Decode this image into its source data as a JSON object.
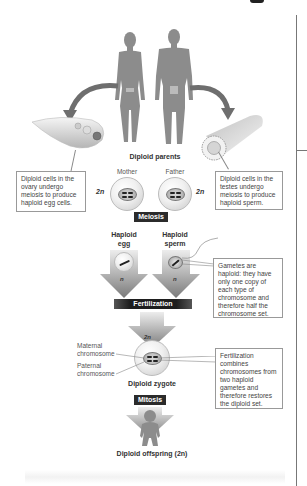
{
  "parents": {
    "label": "Diploid parents",
    "mother": "Mother",
    "father": "Father",
    "ploidy_left": "2n",
    "ploidy_right": "2n"
  },
  "callouts": {
    "ovary": "Diploid cells in the ovary undergo meiosis to produce haploid egg cells.",
    "testes": "Diploid cells in the testes undergo meiosis to produce haploid sperm.",
    "gametes": "Gametes are haploid: they have only one copy of each type of chromosome and therefore half the chromosome set.",
    "fertilization": "Fertilization combines chromosomes from two haploid gametes and therefore restores the diploid set."
  },
  "process_tags": {
    "meiosis": "Meiosis",
    "fertilization": "Fertilization",
    "mitosis": "Mitosis"
  },
  "gametes": {
    "egg_label_1": "Haploid",
    "egg_label_2": "egg",
    "sperm_label_1": "Haploid",
    "sperm_label_2": "sperm",
    "egg_ploidy": "n",
    "sperm_ploidy": "n"
  },
  "zygote": {
    "ploidy": "2n",
    "maternal_1": "Maternal",
    "maternal_2": "chromosome",
    "paternal_1": "Paternal",
    "paternal_2": "chromosome",
    "label": "Diploid zygote"
  },
  "offspring": {
    "label": "Diploid offspring (2n)"
  },
  "colors": {
    "figure_gray": "#8c8c8c",
    "tag_bg": "#2b2b2b",
    "callout_border": "#999999",
    "arrow_dark": "#7a7a7a",
    "arrow_light": "#e6e6e6"
  }
}
